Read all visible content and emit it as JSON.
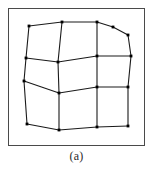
{
  "figure": {
    "caption": "(a)",
    "frame": {
      "x": 8.5,
      "y": 8.5,
      "width": 136,
      "height": 137,
      "stroke": "#4a4a4a",
      "stroke_width": 1
    },
    "mesh": {
      "description": "distorted quadrilateral mesh",
      "rows": 4,
      "cols": 5,
      "node_stroke": "#000000",
      "node_fill": "#000000",
      "node_size": 2.6,
      "edge_stroke": "#1a1a1a",
      "edge_width": 1.1,
      "nodes": [
        [
          {
            "x": 29,
            "y": 26
          },
          {
            "x": 62,
            "y": 22
          },
          {
            "x": 97,
            "y": 22
          },
          {
            "x": 128,
            "y": 29
          },
          {
            "x": 128,
            "y": 29
          }
        ],
        [
          {
            "x": 26,
            "y": 58
          },
          {
            "x": 58,
            "y": 62
          },
          {
            "x": 97,
            "y": 56
          },
          {
            "x": 131,
            "y": 56
          }
        ],
        [
          {
            "x": 24,
            "y": 81
          },
          {
            "x": 59,
            "y": 93
          },
          {
            "x": 97,
            "y": 87
          },
          {
            "x": 128,
            "y": 87
          }
        ],
        [
          {
            "x": 27,
            "y": 124
          },
          {
            "x": 59,
            "y": 130
          },
          {
            "x": 97,
            "y": 127
          },
          {
            "x": 128,
            "y": 126
          }
        ]
      ],
      "extra_nodes": [
        {
          "x": 113,
          "y": 27
        }
      ],
      "polylines": [
        {
          "name": "row-1-top",
          "points": "29,26 62,22 97,22 113,27 128,35"
        },
        {
          "name": "row-2",
          "points": "26,58 58,62 97,56 131,56"
        },
        {
          "name": "row-3",
          "points": "24,81 59,93 97,87 128,87"
        },
        {
          "name": "row-4-bottom",
          "points": "27,124 59,130 97,127 128,126"
        },
        {
          "name": "col-1-left",
          "points": "29,26 26,58 24,81 27,124"
        },
        {
          "name": "col-2",
          "points": "62,22 58,62 59,93 59,130"
        },
        {
          "name": "col-3",
          "points": "97,22 97,56 97,87 97,127"
        },
        {
          "name": "col-4-right",
          "points": "128,35 131,56 128,87 128,126"
        }
      ]
    }
  }
}
